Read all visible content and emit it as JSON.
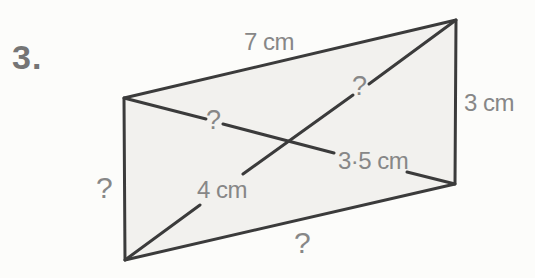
{
  "problem_number": "3.",
  "figure": {
    "side_labels": {
      "top": "7 cm",
      "right": "3 cm",
      "bottom": "?",
      "left": "?"
    },
    "diagonal_labels": {
      "ac_upper_half": "?",
      "ac_lower_half": "3·5 cm",
      "db_upper_half": "?",
      "db_lower_half": "4 cm"
    },
    "colors": {
      "outline": "#3b3b3b",
      "fill": "#f2f1ee",
      "label_text": "#878787",
      "page_background": "#fcfcfa"
    }
  }
}
